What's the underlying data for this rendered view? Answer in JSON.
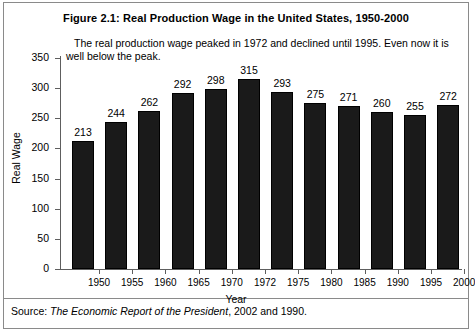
{
  "figure": {
    "title": "Figure 2.1: Real Production Wage in the United States, 1950-2000",
    "annotation": "The real production wage peaked in 1972 and declined until 1995. Even now it is well below the peak.",
    "source_prefix": "Source:",
    "source_title": "The Economic Report of the President",
    "source_suffix": ", 2002 and 1990."
  },
  "chart_data": {
    "type": "bar",
    "title": "Figure 2.1: Real Production Wage in the United States, 1950-2000",
    "xlabel": "Year",
    "ylabel": "Real Wage",
    "categories": [
      "1950",
      "1955",
      "1960",
      "1965",
      "1970",
      "1972",
      "1975",
      "1980",
      "1985",
      "1990",
      "1995",
      "2000"
    ],
    "values": [
      213,
      244,
      262,
      292,
      298,
      315,
      293,
      275,
      271,
      260,
      255,
      272
    ],
    "ylim": [
      0,
      350
    ],
    "yticks": [
      0,
      50,
      100,
      150,
      200,
      250,
      300,
      350
    ],
    "ytick_labels": [
      "0",
      "50",
      "100",
      "150",
      "200",
      "250",
      "300",
      "350"
    ],
    "grid": false,
    "legend": null,
    "bar_color": "#1a1a1a",
    "data_labels": [
      "213",
      "244",
      "262",
      "292",
      "298",
      "315",
      "293",
      "275",
      "271",
      "260",
      "255",
      "272"
    ],
    "annotations": [
      "The real production wage peaked in 1972 and declined until 1995. Even now it is well below the peak."
    ]
  }
}
